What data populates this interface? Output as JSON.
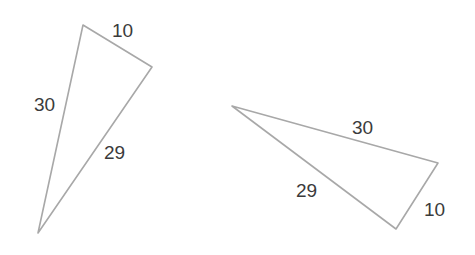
{
  "figure": {
    "kind": "geometry-figure",
    "background_color": "#ffffff",
    "stroke_color": "#a8a8a8",
    "stroke_width": 1.6,
    "label_color": "#3b3b3b",
    "label_font_size": 19,
    "width": 475,
    "height": 255
  },
  "shapes": [
    {
      "name": "triangle-left",
      "vertices": [
        {
          "name": "apex",
          "x": 83,
          "y": 25
        },
        {
          "name": "right",
          "x": 152,
          "y": 67
        },
        {
          "name": "bottom",
          "x": 38,
          "y": 233
        }
      ],
      "labels": [
        {
          "name": "side-10",
          "text": "10",
          "x": 112,
          "y": 21
        },
        {
          "name": "side-30",
          "text": "30",
          "x": 34,
          "y": 95
        },
        {
          "name": "side-29",
          "text": "29",
          "x": 104,
          "y": 143
        }
      ]
    },
    {
      "name": "triangle-right",
      "vertices": [
        {
          "name": "left",
          "x": 232,
          "y": 106
        },
        {
          "name": "right",
          "x": 438,
          "y": 163
        },
        {
          "name": "bottom",
          "x": 396,
          "y": 229
        }
      ],
      "labels": [
        {
          "name": "side-30",
          "text": "30",
          "x": 352,
          "y": 118
        },
        {
          "name": "side-29",
          "text": "29",
          "x": 296,
          "y": 181
        },
        {
          "name": "side-10",
          "text": "10",
          "x": 424,
          "y": 200
        }
      ]
    }
  ],
  "chart_data": {
    "type": "diagram",
    "title": "",
    "shapes": [
      {
        "label": "Triangle 1",
        "side_lengths": [
          10,
          29,
          30
        ],
        "side_label_order": [
          "10",
          "30",
          "29"
        ]
      },
      {
        "label": "Triangle 2",
        "side_lengths": [
          30,
          29,
          10
        ],
        "side_label_order": [
          "30",
          "29",
          "10"
        ]
      }
    ],
    "values": [
      10,
      29,
      30,
      30,
      29,
      10
    ],
    "categories": [
      "10",
      "30",
      "29",
      "30",
      "29",
      "10"
    ]
  }
}
